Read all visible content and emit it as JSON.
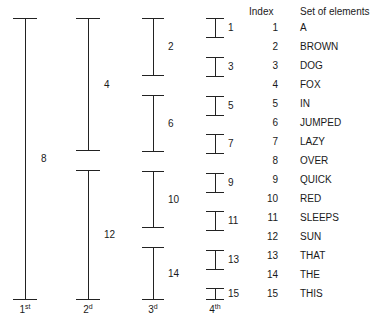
{
  "figure": {
    "line_color": "#222222",
    "text_color": "#1a1a1a",
    "background": "#ffffff"
  },
  "passes": [
    {
      "name": "pass-1",
      "ordinal": "1",
      "ordinal_suffix": "st",
      "brackets": [
        {
          "label": "8",
          "top": 18,
          "bottom": 300
        }
      ]
    },
    {
      "name": "pass-2",
      "ordinal": "2",
      "ordinal_suffix": "d",
      "brackets": [
        {
          "label": "4",
          "top": 18,
          "bottom": 151
        },
        {
          "label": "12",
          "top": 170,
          "bottom": 300
        }
      ]
    },
    {
      "name": "pass-3",
      "ordinal": "3",
      "ordinal_suffix": "d",
      "brackets": [
        {
          "label": "2",
          "top": 18,
          "bottom": 76
        },
        {
          "label": "6",
          "top": 95,
          "bottom": 152
        },
        {
          "label": "10",
          "top": 171,
          "bottom": 228
        },
        {
          "label": "14",
          "top": 247,
          "bottom": 300
        }
      ]
    },
    {
      "name": "pass-4",
      "ordinal": "4",
      "ordinal_suffix": "th",
      "brackets": [
        {
          "label": "1",
          "top": 18,
          "bottom": 38
        },
        {
          "label": "3",
          "top": 57,
          "bottom": 77
        },
        {
          "label": "5",
          "top": 96,
          "bottom": 116
        },
        {
          "label": "7",
          "top": 134,
          "bottom": 154
        },
        {
          "label": "9",
          "top": 173,
          "bottom": 193
        },
        {
          "label": "11",
          "top": 211,
          "bottom": 231
        },
        {
          "label": "13",
          "top": 250,
          "bottom": 270
        },
        {
          "label": "15",
          "top": 288,
          "bottom": 300
        }
      ]
    }
  ],
  "table": {
    "headers": {
      "index": "Index",
      "elements": "Set of elements"
    },
    "rows": [
      {
        "index": "1",
        "element": "A"
      },
      {
        "index": "2",
        "element": "BROWN"
      },
      {
        "index": "3",
        "element": "DOG"
      },
      {
        "index": "4",
        "element": "FOX"
      },
      {
        "index": "5",
        "element": "IN"
      },
      {
        "index": "6",
        "element": "JUMPED"
      },
      {
        "index": "7",
        "element": "LAZY"
      },
      {
        "index": "8",
        "element": "OVER"
      },
      {
        "index": "9",
        "element": "QUICK"
      },
      {
        "index": "10",
        "element": "RED"
      },
      {
        "index": "11",
        "element": "SLEEPS"
      },
      {
        "index": "12",
        "element": "SUN"
      },
      {
        "index": "13",
        "element": "THAT"
      },
      {
        "index": "14",
        "element": "THE"
      },
      {
        "index": "15",
        "element": "THIS"
      }
    ]
  }
}
